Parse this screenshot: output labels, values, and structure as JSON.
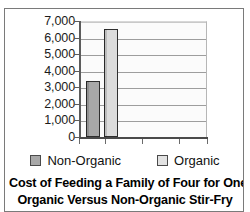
{
  "chart_data": {
    "type": "bar",
    "title": "Cost of Feeding a Family of Four for One Year: Organic Versus Non-Organic Stir-Fry",
    "title_line1": "Cost of Feeding a Family of Four for One Year:",
    "title_line2": "Organic Versus Non-Organic Stir-Fry",
    "xlabel": "",
    "ylabel": "",
    "categories": [
      "Stir-Fry"
    ],
    "series": [
      {
        "name": "Non-Organic",
        "values": [
          3400
        ],
        "color": "#a8a8a8"
      },
      {
        "name": "Organic",
        "values": [
          6500
        ],
        "color": "#dcdcdc"
      }
    ],
    "ylim": [
      0,
      7000
    ],
    "ytick_values": [
      7000,
      6000,
      5000,
      4000,
      3000,
      2000,
      1000,
      0
    ],
    "ytick_labels": [
      "7,000",
      "6,000",
      "5,000",
      "4,000",
      "3,000",
      "2,000",
      "1,000",
      "0"
    ],
    "grid": true,
    "grid_axis": "y",
    "legend_position": "bottom",
    "legend": [
      {
        "label": "Non-Organic",
        "swatch_color": "#a8a8a8"
      },
      {
        "label": "Organic",
        "swatch_color": "#e2e2e2"
      }
    ],
    "plot_background": "#fbfbfb",
    "border_color": "#7a7a7a"
  }
}
